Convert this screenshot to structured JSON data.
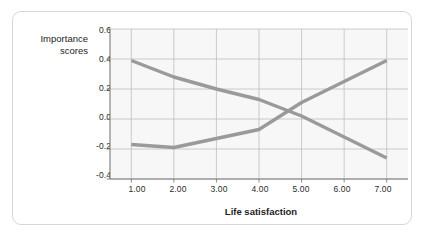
{
  "chart_data": {
    "type": "line",
    "title": "",
    "xlabel": "Life satisfaction",
    "ylabel": "Importance scores",
    "ylabel_line1": "Importance",
    "ylabel_line2": "scores",
    "x": [
      1.0,
      2.0,
      3.0,
      4.0,
      5.0,
      6.0,
      7.0
    ],
    "xticklabels": [
      "1.00",
      "2.00",
      "3.00",
      "4.00",
      "5.00",
      "6.00",
      "7.00"
    ],
    "yticklabels": [
      "0.6",
      "0.4",
      "0.2",
      "0.0",
      "-0.2",
      "-0.4"
    ],
    "yticks": [
      0.6,
      0.4,
      0.2,
      0.0,
      -0.2,
      -0.4
    ],
    "xlim": [
      0.5,
      7.5
    ],
    "ylim": [
      -0.4,
      0.6
    ],
    "grid": true,
    "legend_position": "inline-annotations",
    "series": [
      {
        "name": "Money",
        "label": "Money",
        "color": "#9a9a9a",
        "values": [
          0.39,
          0.28,
          0.2,
          0.13,
          0.02,
          -0.12,
          -0.26
        ]
      },
      {
        "name": "Love",
        "label": "Love",
        "color": "#9a9a9a",
        "values": [
          -0.17,
          -0.19,
          -0.13,
          -0.07,
          0.11,
          0.25,
          0.39
        ]
      }
    ],
    "annotations": [
      {
        "text": "Money",
        "x": 2.75,
        "y": 0.36
      },
      {
        "text": "Love",
        "x": 5.45,
        "y": 0.36
      }
    ]
  },
  "style": {
    "line_color": "#9a9a9a",
    "grid_color": "#bfbfbf",
    "axis_color": "#7a7a7a",
    "plot_background": "#f7f7f7",
    "frame_border": "#d7d7d7",
    "text_color": "#1d1d1d"
  }
}
